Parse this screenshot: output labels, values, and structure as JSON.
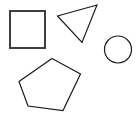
{
  "canvas": {
    "width": 140,
    "height": 125,
    "background_color": "#ffffff",
    "description": "Four outlined geometric shapes on a plain white background"
  },
  "palette": {
    "square_stroke": "#3f3f3f",
    "outline_stroke": "#1a1a1a",
    "fill": "none"
  },
  "shapes": [
    {
      "id": "square",
      "name": "square",
      "kind": "rect",
      "stroke_color": "#3f3f3f",
      "stroke_width": 2,
      "fill": "none",
      "x": 10,
      "y": 11,
      "width": 35,
      "height": 37
    },
    {
      "id": "triangle",
      "name": "triangle",
      "kind": "polygon",
      "stroke_color": "#1a1a1a",
      "stroke_width": 1.2,
      "fill": "none",
      "points": "97,5 57.5,16 82,42.5"
    },
    {
      "id": "circle",
      "name": "circle",
      "kind": "circle",
      "stroke_color": "#1a1a1a",
      "stroke_width": 1.2,
      "fill": "none",
      "cx": 118,
      "cy": 49.5,
      "r": 13.5
    },
    {
      "id": "pentagon",
      "name": "pentagon",
      "kind": "polygon",
      "stroke_color": "#1a1a1a",
      "stroke_width": 1.2,
      "fill": "none",
      "points": "52,58.5 80.5,74 63,110.5 28,106 19,81.5"
    }
  ]
}
